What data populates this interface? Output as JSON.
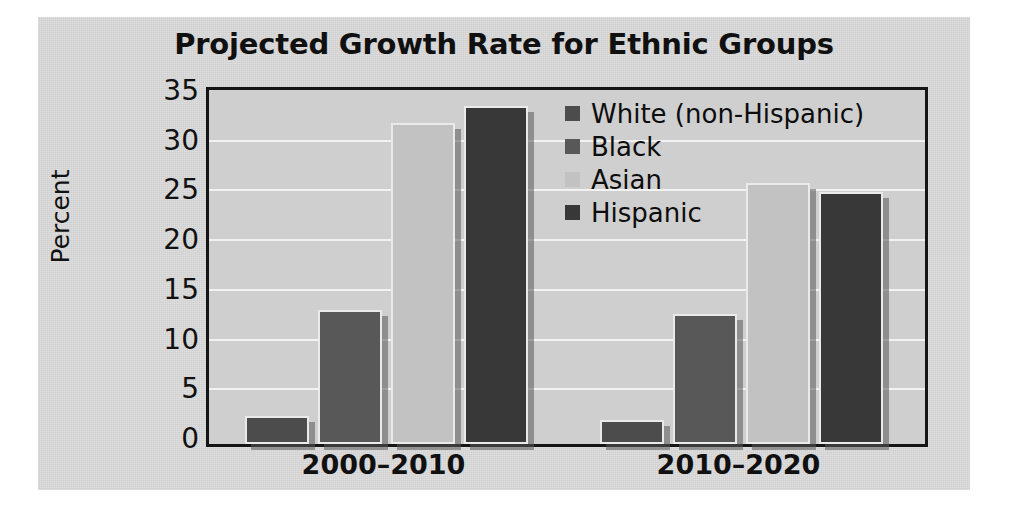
{
  "chart_data": {
    "type": "bar",
    "title": "Projected Growth Rate for Ethnic Groups",
    "xlabel": "",
    "ylabel": "Percent",
    "ylim": [
      0,
      35
    ],
    "ytick_step": 5,
    "yticks": [
      "0",
      "5",
      "10",
      "15",
      "20",
      "25",
      "30",
      "35"
    ],
    "grid": true,
    "grid_axis": "y",
    "legend_position": "upper right inside plot",
    "categories": [
      "2000–2010",
      "2010–2020"
    ],
    "series": [
      {
        "name": "White (non-Hispanic)",
        "color": "#4c4c4c",
        "values": [
          2.8,
          2.4
        ]
      },
      {
        "name": "Black",
        "color": "#585858",
        "values": [
          13.5,
          13.1
        ]
      },
      {
        "name": "Asian",
        "color": "#c2c2c2",
        "values": [
          32.3,
          26.3
        ]
      },
      {
        "name": "Hispanic",
        "color": "#383838",
        "values": [
          34.0,
          25.3
        ]
      }
    ]
  },
  "figure": {
    "background_color": "#dcdcdc",
    "plot_background_color": "#cfcfcf",
    "axis_color": "#151515",
    "gridline_color": "#f2f2f2"
  }
}
